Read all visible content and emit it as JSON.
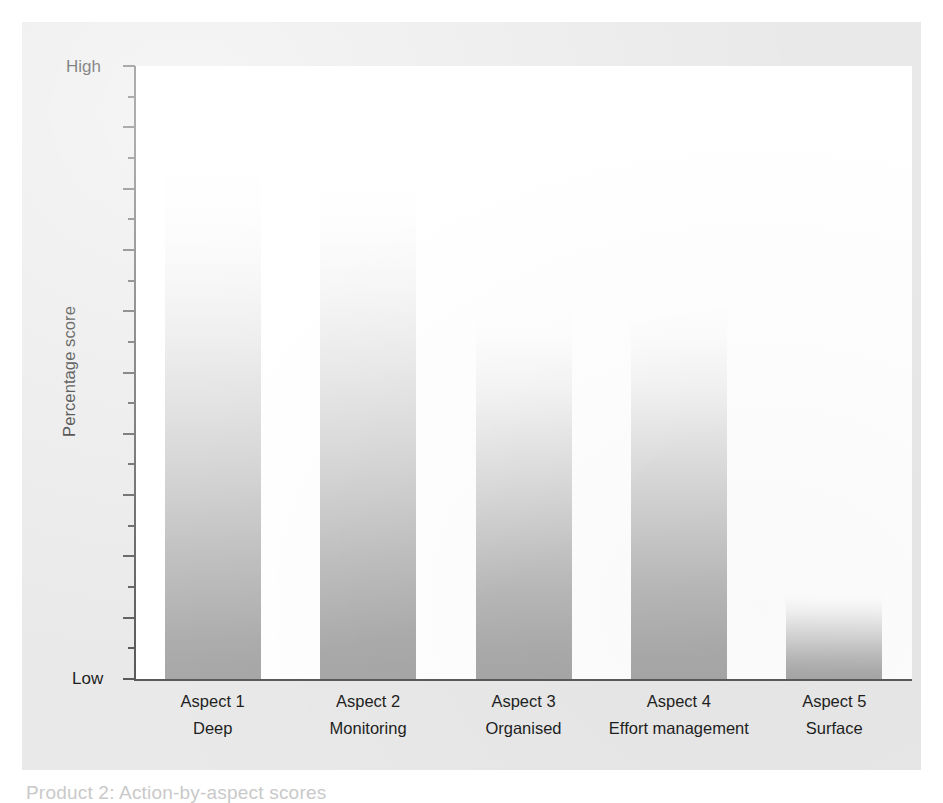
{
  "figure": {
    "caption": "Product 2: Action-by-aspect scores"
  },
  "axes": {
    "y_title": "Percentage score",
    "y_high_label": "High",
    "y_low_label": "Low"
  },
  "chart_data": {
    "type": "bar",
    "title": "",
    "xlabel": "",
    "ylabel": "Percentage score",
    "ylim": [
      0,
      100
    ],
    "ytick_labels": [
      "Low",
      "High"
    ],
    "grid": false,
    "legend": "none",
    "bar_color": "#a7a7a7",
    "bar_gradient_top": "#ffffff",
    "bar_gradient_bottom": "#a7a7a7",
    "categories": [
      "Aspect 1",
      "Aspect 2",
      "Aspect 3",
      "Aspect 4",
      "Aspect 5"
    ],
    "category_sublabels": [
      "Deep",
      "Monitoring",
      "Organised",
      "Effort management",
      "Surface"
    ],
    "values": [
      84,
      82,
      61,
      61,
      14
    ],
    "series": [
      {
        "name": "Percentage score",
        "values": [
          84,
          82,
          61,
          61,
          14
        ]
      }
    ],
    "points": [
      {
        "category": "Aspect 1",
        "sublabel": "Deep",
        "value": 84
      },
      {
        "category": "Aspect 2",
        "sublabel": "Monitoring",
        "value": 82
      },
      {
        "category": "Aspect 3",
        "sublabel": "Organised",
        "value": 61
      },
      {
        "category": "Aspect 4",
        "sublabel": "Effort management",
        "value": 61
      },
      {
        "category": "Aspect 5",
        "sublabel": "Surface",
        "value": 14
      }
    ]
  }
}
